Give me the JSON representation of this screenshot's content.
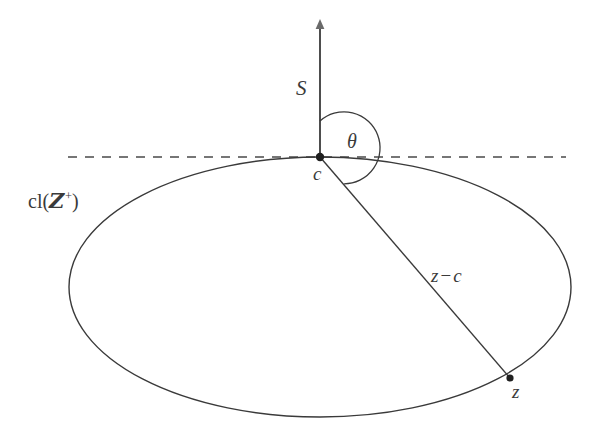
{
  "figure": {
    "type": "geometric-diagram",
    "background_color": "#ffffff",
    "stroke_color": "#3a3a3a",
    "labels": {
      "cone_axis": "S",
      "angle": "θ",
      "apex_point": "c",
      "region_prefix": "cl(",
      "region_symbol": "Z",
      "region_superscript": "+",
      "region_suffix": ")",
      "region_full": "cl(Z+)",
      "vector_z_minus_c_first": "z",
      "vector_z_minus_c_minus": "−",
      "vector_z_minus_c_second": "c",
      "vector_full": "z − c",
      "boundary_point": "z"
    },
    "geometry": {
      "center_point": {
        "x": 320,
        "y": 157
      },
      "axis_arrow_tip": {
        "x": 320,
        "y": 22
      },
      "axis_bottom": {
        "x": 320,
        "y": 157
      },
      "dashed_line_start_x": 68,
      "dashed_line_end_x": 566,
      "dashed_line_y": 157,
      "ellipse_center": {
        "x": 320,
        "y": 287
      },
      "ellipse_rx": 251,
      "ellipse_ry": 130,
      "boundary_point_z": {
        "x": 510,
        "y": 378
      },
      "angle_arc_radius": 36,
      "angle_arc_start_deg": 90,
      "angle_arc_end_deg": -48
    },
    "elements": [
      "vertical-axis-arrow",
      "horizontal-dashed-line",
      "ellipse-boundary",
      "angle-arc",
      "radius-segment",
      "center-dot",
      "boundary-dot"
    ]
  }
}
